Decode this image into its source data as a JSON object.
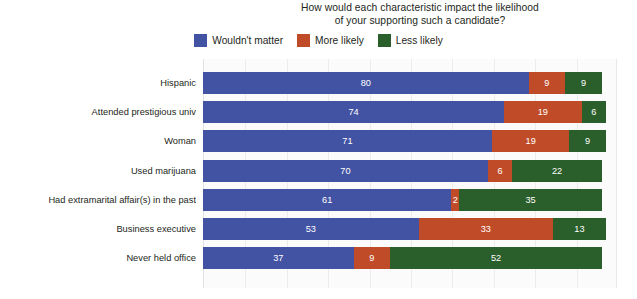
{
  "chart_data": {
    "type": "bar",
    "orientation": "horizontal",
    "stacked": true,
    "title": "How would each characteristic impact the likelihood of your supporting such a candidate?",
    "title_lines": [
      "How would each characteristic impact the likelihood",
      "of your supporting such a candidate?"
    ],
    "xlabel": "",
    "ylabel": "",
    "xlim": [
      0,
      100
    ],
    "grid": true,
    "legend_position": "top",
    "categories": [
      "Hispanic",
      "Attended prestigious univ",
      "Woman",
      "Used marijuana",
      "Had extramarital affair(s) in the past",
      "Business executive",
      "Never held office"
    ],
    "series": [
      {
        "name": "Wouldn't matter",
        "color": "#4353a4",
        "values": [
          80,
          74,
          71,
          70,
          61,
          53,
          37
        ]
      },
      {
        "name": "More likely",
        "color": "#bf4b28",
        "values": [
          9,
          19,
          19,
          6,
          2,
          33,
          9
        ]
      },
      {
        "name": "Less likely",
        "color": "#2a5e2a",
        "values": [
          9,
          6,
          9,
          22,
          35,
          13,
          52
        ]
      }
    ]
  },
  "colors": {
    "wouldnt_matter": "#4353a4",
    "more_likely": "#bf4b28",
    "less_likely": "#2a5e2a",
    "plot_background": "#fbfbfc",
    "gridline": "#ececed",
    "text": "#231f20",
    "value_label": "#ffffff"
  }
}
